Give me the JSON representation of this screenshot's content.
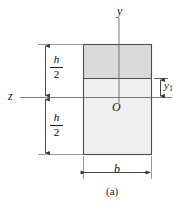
{
  "figure": {
    "caption": "(a)",
    "axes": {
      "vertical_label": "y",
      "horizontal_label": "z",
      "origin_label": "O"
    },
    "dimensions": {
      "upper_half": {
        "numerator": "h",
        "denominator": "2"
      },
      "lower_half": {
        "numerator": "h",
        "denominator": "2"
      },
      "width_label": "b",
      "offset_label": "y",
      "offset_subscript": "1"
    },
    "regions": {
      "upper_fill": "#d9d9d9",
      "lower_fill": "#efefef",
      "outline": "#4d4d4d"
    },
    "line_color": "#4d4d4d",
    "text_color": "#1a1a1a",
    "background": "#ffffff"
  }
}
